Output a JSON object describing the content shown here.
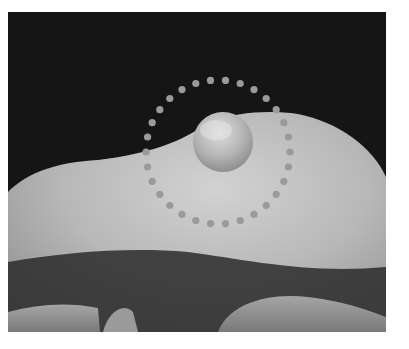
{
  "image": {
    "description": "Grayscale clinical photograph of a rounded nodule on the dorsal skin of a finger/hand, highlighted by a dotted circle",
    "annotation": {
      "shape": "dotted-circle",
      "color": "#9a9a9a",
      "center": [
        210,
        140
      ],
      "radius": 72,
      "dot_count": 30
    },
    "colors": {
      "background": "#151515",
      "skin_light": "#c9c9c9",
      "skin_mid": "#a8a8a8",
      "shadow": "#2a2a2a",
      "nodule": "#bdbdbd"
    }
  }
}
